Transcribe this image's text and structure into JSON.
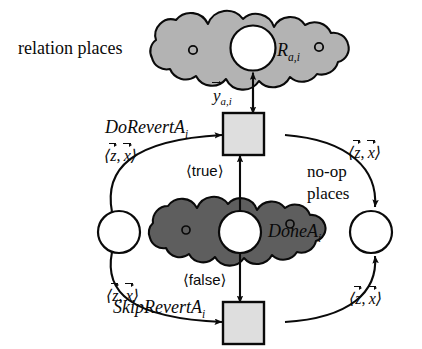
{
  "diagram": {
    "type": "petri-net",
    "canvas": {
      "width": 422,
      "height": 349
    },
    "colors": {
      "relation_cloud_fill": "#b3b3b3",
      "done_cloud_fill": "#5e5e5e",
      "transition_fill": "#dedede",
      "place_fill": "#ffffff",
      "stroke": "#0a0a0a",
      "background": "#ffffff"
    },
    "annotations": {
      "relation_places": "relation places",
      "noop_places_line1": "no-op",
      "noop_places_line2": "places"
    },
    "clouds": [
      {
        "id": "relation-places-cloud",
        "label": "R",
        "label_sub": "a,i",
        "shade": "light",
        "tokens": 2
      },
      {
        "id": "done-cloud",
        "label": "DoneA",
        "label_sub": "i",
        "shade": "dark",
        "tokens": 2
      }
    ],
    "places": [
      {
        "id": "relation-place",
        "kind": "place",
        "fill": "white"
      },
      {
        "id": "done-place",
        "kind": "place",
        "fill": "white"
      },
      {
        "id": "noop-place-left",
        "kind": "place",
        "fill": "white"
      },
      {
        "id": "noop-place-right",
        "kind": "place",
        "fill": "white"
      }
    ],
    "transitions": [
      {
        "id": "do-revert",
        "label": "DoRevertA",
        "label_sub": "i"
      },
      {
        "id": "skip-revert",
        "label": "SkipRevertA",
        "label_sub": "i"
      }
    ],
    "arcs": [
      {
        "id": "arc-y",
        "from": "do-revert",
        "to": "relation-place",
        "label_base": "y",
        "label_sub": "a,i",
        "vector": true
      },
      {
        "id": "arc-true",
        "from": "done-place",
        "to": "do-revert",
        "label": "true",
        "bracketed": true
      },
      {
        "id": "arc-false",
        "from": "done-place",
        "to": "skip-revert",
        "label": "false",
        "bracketed": true
      },
      {
        "id": "arc-zx-top-left",
        "from": "noop-place-left",
        "to": "do-revert",
        "label_vars": [
          "z",
          "x"
        ],
        "bracketed": true
      },
      {
        "id": "arc-zx-top-right",
        "from": "do-revert",
        "to": "noop-place-right",
        "label_vars": [
          "z",
          "x"
        ],
        "bracketed": true
      },
      {
        "id": "arc-zx-bottom-left",
        "from": "noop-place-left",
        "to": "skip-revert",
        "label_vars": [
          "z",
          "x"
        ],
        "bracketed": true
      },
      {
        "id": "arc-zx-bottom-right",
        "from": "skip-revert",
        "to": "noop-place-right",
        "label_vars": [
          "z",
          "x"
        ],
        "bracketed": true
      }
    ]
  }
}
